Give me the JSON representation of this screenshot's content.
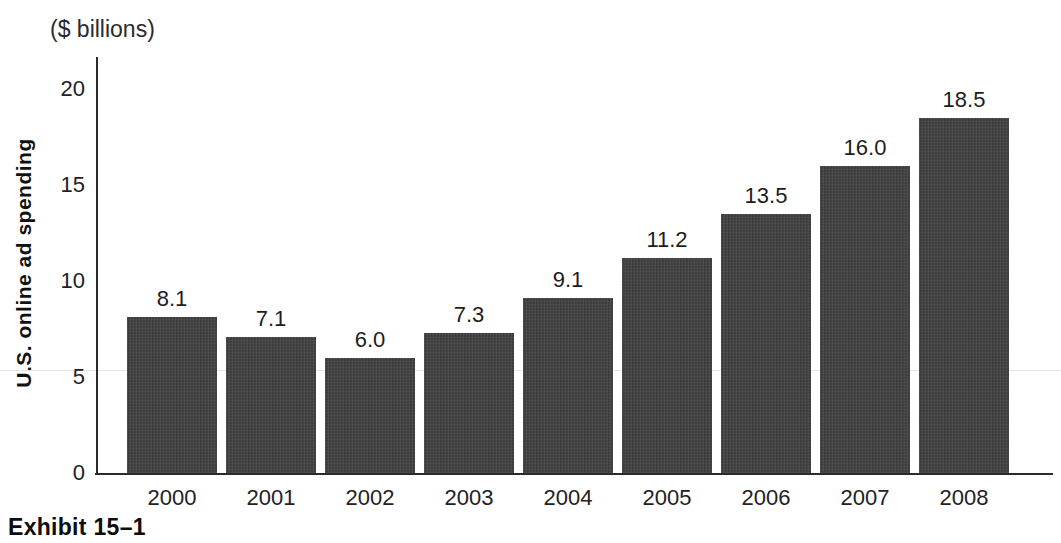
{
  "header": {
    "units_label": "($ billions)"
  },
  "caption": "Exhibit 15–1",
  "colors": {
    "bar_fill": "#424242",
    "axis": "#2b2b2b",
    "text": "#1f1f1f",
    "background": "#ffffff",
    "faint_gridline": "#e7e7e5"
  },
  "chart_data": {
    "type": "bar",
    "title": "",
    "xlabel": "",
    "ylabel": "U.S. online ad spending",
    "units": "$ billions",
    "categories": [
      "2000",
      "2001",
      "2002",
      "2003",
      "2004",
      "2005",
      "2006",
      "2007",
      "2008"
    ],
    "values": [
      8.1,
      7.1,
      6.0,
      7.3,
      9.1,
      11.2,
      13.5,
      16.0,
      18.5
    ],
    "data_labels": [
      "8.1",
      "7.1",
      "6.0",
      "7.3",
      "9.1",
      "11.2",
      "13.5",
      "16.0",
      "18.5"
    ],
    "ylim": [
      0,
      20
    ],
    "yticks": [
      0,
      5,
      10,
      15,
      20
    ],
    "grid": false,
    "legend": "none",
    "data_labels_shown": true
  }
}
